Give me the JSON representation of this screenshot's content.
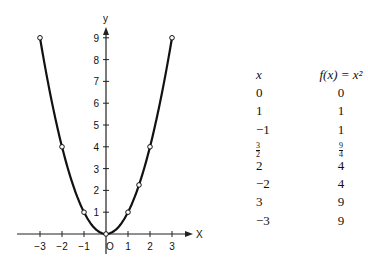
{
  "chart_data": {
    "type": "line",
    "title": "",
    "xlabel": "x",
    "ylabel": "y",
    "function": "f(x) = x^2",
    "xlim": [
      -3.5,
      3.8
    ],
    "ylim": [
      -0.7,
      9.6
    ],
    "x_ticks": [
      -3,
      -2,
      -1,
      0,
      1,
      2,
      3
    ],
    "x_tick_labels": [
      "-3",
      "-2",
      "-1",
      "O",
      "1",
      "2",
      "3"
    ],
    "y_ticks": [
      1,
      2,
      3,
      4,
      5,
      6,
      7,
      8,
      9
    ],
    "y_tick_labels": [
      "1",
      "2",
      "3",
      "4",
      "5",
      "6",
      "7",
      "8",
      "9"
    ],
    "grid": false,
    "legend": null,
    "marked_points": [
      {
        "x": -3,
        "y": 9
      },
      {
        "x": -2,
        "y": 4
      },
      {
        "x": -1,
        "y": 1
      },
      {
        "x": 0,
        "y": 0
      },
      {
        "x": 1,
        "y": 1
      },
      {
        "x": 1.5,
        "y": 2.25
      },
      {
        "x": 2,
        "y": 4
      },
      {
        "x": 3,
        "y": 9
      }
    ]
  },
  "table": {
    "headers": {
      "x": "x",
      "fx": "f(x) = x²"
    },
    "rows": [
      {
        "x": "0",
        "fx": "0"
      },
      {
        "x": "1",
        "fx": "1"
      },
      {
        "x": "−1",
        "fx": "1"
      },
      {
        "x": "3/2",
        "fx": "9/4"
      },
      {
        "x": "2",
        "fx": "4"
      },
      {
        "x": "−2",
        "fx": "4"
      },
      {
        "x": "3",
        "fx": "9"
      },
      {
        "x": "−3",
        "fx": "9"
      }
    ]
  }
}
